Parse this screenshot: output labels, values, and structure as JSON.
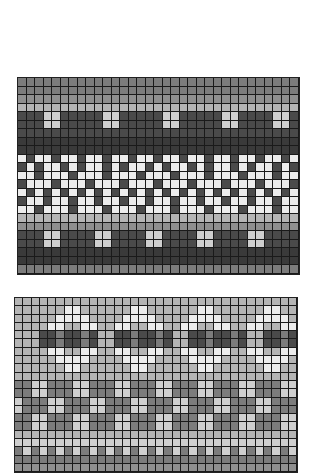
{
  "figures": [
    {
      "name": "top-knitting-chart",
      "x": 17,
      "y": 77,
      "cols": 33,
      "cell_w": 8.5,
      "cell_h": 8.5,
      "rows": [
        "MMMMMMMMMMMMMMMMMMMMMMMMMMMMMMMMM",
        "MMMMMMMMMMMMMMMMMMMMMMMMMMMMMMMMM",
        "NNNNNNNNNNNNNNNNNNNNNNNNNNNNNNNNN",
        "PPPPPPPPPPPPPPPPPPPPPPPPPPPPPPPPP",
        "DDDLLDDDDDLLDDDDDLLDDDDDLLDDDDLLD",
        "DDDLLDDDDDLLDDDDDLLDDDDDLLDDDDLLD",
        "DDDDDDDDDDDDDDDDDDDDDDDDDDDDDDDDD",
        "KKKKKKKKKKKKKKKKKKKKKKKKKKKKKKKKK",
        "KKKKKKKKKKKKKKKKKKKKKKKKKKKKKKKKK",
        "WDWWDWWDWWDWWDWWDWWDWWDWWDWWDWWDW",
        "DWDWWDWDWWDWDWWDWDWWDWDWWDWDWWDWD",
        "WWDWWWDWWWDWWWDWWWDWWWDWWWDWWWDWW",
        "DWWWDWWWDWWWDWWWDWWWDWWWDWWWDWWWD",
        "WDWDWDWDWDWDWDWDWDWDWDWDWDWDWDWDW",
        "DWWDWWDWWDWWDWWDWWDWWDWWDWWDWWDWW",
        "WWDWWWDWWWDWWWDWWWDWWWDWWWDWWWDWW",
        "PPPPPPPPPPPPPPPPPPPPPPPPPPPPPPPPP",
        "NNNNNNNNNNNNNNNNNNNNNNNNNNNNNNNNN",
        "DDDLLDDDDLLDDDDLLDDDDLLDDDDLLDDDD",
        "DDDLLDDDDLLDDDDLLDDDDLLDDDDLLDDDD",
        "KKKKKKKKKKKKKKKKKKKKKKKKKKKKKKKKK",
        "KKKKKKKKKKKKKKKKKKKKKKKKKKKKKKKKK",
        "MMMMMMMMMMMMMMMMMMMMMMMMMMMMMMMMM"
      ]
    },
    {
      "name": "bottom-knitting-chart",
      "x": 14,
      "y": 297,
      "cols": 34,
      "cell_w": 8.3,
      "cell_h": 8.3,
      "rows": [
        "PPPPPPPPPPPPPPPPPPPPPPPPPPPPPPPPPP",
        "PPPPPPWWPPPPPPWWPPPPPPWWPPPPPPWWPP",
        "PPPPPWWWWPPPPWWWWPPPPWWWWPPPPWWWWP",
        "PPPPWWPPWWPPWWPPWWPPWWPPWWPPWWPPWW",
        "PPPDDMDDMDPPDDMDDMDPPDDMDDMDPPDDMD",
        "PPPDDMDDMDPPDDMDDMDPPDDMDDMDPPDDMD",
        "PPPPWWPPWWPPWWPPWWPPWWPPWWPPWWPPWW",
        "PPPPPWWWWPPPPWWWWPPPPWWWWPPPPWWWWP",
        "PPPPPPWWPPPPPPWWPPPPPPWWPPPPPPWWPP",
        "PPPPPPPPPPPPPPPPPPPPPPPPPPPPPPPPPP",
        "MMLLMMMLLMMMLLMMMLLMMMLLMMMLLMMMLL",
        "MMLLMMMLLMMMLLMMMLLMMMLLMMMLLMMMLL",
        "LMMMLLMMMLLMMMLLMMMLLMMMLLMMMLLMMM",
        "LMMMLLMMMLLMMMLLMMMLLMMMLLMMMLLMMM",
        "MMLLMMMLLMMMLLMMMLLMMMLLMMMLLMMMLL",
        "MMLLMMMLLMMMLLMMMLLMMMLLMMMLLMMMLL",
        "PPPPPPPPPPPPPPPPPPPPPPPPPPPPPPPPPP",
        "LLLLLLLLLLLLLLLLLLLLLLLLLLLLLLLLLL",
        "MLMLMLMLMLMLMLMLMLMLMLMLMLMLMLMLML",
        "MMMMMMMMMMMMMMMMMMMMMMMMMMMMMMMMMM",
        "NNNNNNNNNNNNNNNNNNNNNNNNNNNNNNNNNN"
      ]
    }
  ]
}
